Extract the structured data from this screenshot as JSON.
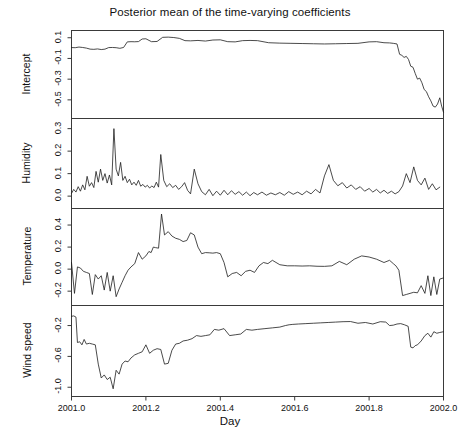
{
  "chart_data": {
    "type": "line",
    "title": "Posterior mean of the time-varying coefficients",
    "xlabel": "Day",
    "ylabel": "",
    "grid": false,
    "legend": "none",
    "xlim": [
      2001.0,
      2002.0
    ],
    "xticks": [
      2001.0,
      2001.2,
      2001.4,
      2001.6,
      2001.8,
      2002.0
    ],
    "xticklabels": [
      "2001.0",
      "2001.2",
      "2001.4",
      "2001.6",
      "2001.8",
      "2002.0"
    ],
    "panels": [
      {
        "name": "intercept",
        "ylabel": "Intercept",
        "ylim": [
          -0.68,
          0.17
        ],
        "yticks": [
          0.1,
          -0.1,
          -0.3,
          -0.5
        ],
        "yticklabels": [
          "0.1",
          "-0.1",
          "-0.3",
          "-0.5"
        ],
        "x": [
          2001.0,
          2001.01,
          2001.02,
          2001.03,
          2001.04,
          2001.05,
          2001.06,
          2001.07,
          2001.08,
          2001.09,
          2001.1,
          2001.11,
          2001.12,
          2001.13,
          2001.14,
          2001.15,
          2001.16,
          2001.17,
          2001.18,
          2001.19,
          2001.2,
          2001.215,
          2001.23,
          2001.245,
          2001.26,
          2001.275,
          2001.29,
          2001.305,
          2001.32,
          2001.34,
          2001.36,
          2001.38,
          2001.4,
          2001.42,
          2001.44,
          2001.46,
          2001.48,
          2001.5,
          2001.53,
          2001.56,
          2001.59,
          2001.62,
          2001.65,
          2001.68,
          2001.71,
          2001.74,
          2001.77,
          2001.8,
          2001.82,
          2001.84,
          2001.855,
          2001.865,
          2001.875,
          2001.882,
          2001.888,
          2001.894,
          2001.9,
          2001.906,
          2001.912,
          2001.918,
          2001.924,
          2001.93,
          2001.936,
          2001.942,
          2001.948,
          2001.954,
          2001.96,
          2001.966,
          2001.972,
          2001.978,
          2001.984,
          2001.99,
          2001.995,
          2002.0
        ],
        "y": [
          0.005,
          0.004,
          0.01,
          0.006,
          0.0,
          -0.01,
          -0.012,
          -0.008,
          -0.014,
          -0.01,
          0.005,
          0.006,
          0.004,
          -0.002,
          0.006,
          0.06,
          0.062,
          0.061,
          0.063,
          0.088,
          0.09,
          0.062,
          0.064,
          0.104,
          0.106,
          0.102,
          0.094,
          0.072,
          0.07,
          0.074,
          0.068,
          0.078,
          0.08,
          0.062,
          0.06,
          0.072,
          0.074,
          0.072,
          0.052,
          0.048,
          0.046,
          0.044,
          0.042,
          0.04,
          0.042,
          0.044,
          0.046,
          0.06,
          0.062,
          0.052,
          0.05,
          0.046,
          0.04,
          -0.06,
          -0.07,
          -0.09,
          -0.08,
          -0.11,
          -0.175,
          -0.185,
          -0.245,
          -0.3,
          -0.29,
          -0.335,
          -0.4,
          -0.42,
          -0.47,
          -0.51,
          -0.56,
          -0.57,
          -0.54,
          -0.48,
          -0.56,
          -0.62
        ]
      },
      {
        "name": "humidity",
        "ylabel": "Humidity",
        "ylim": [
          -0.055,
          0.345
        ],
        "yticks": [
          0.3,
          0.2,
          0.1,
          0.0
        ],
        "yticklabels": [
          "0.3",
          "0.2",
          "0.1",
          "0.0"
        ],
        "x": [
          2001.0,
          2001.006,
          2001.012,
          2001.018,
          2001.024,
          2001.03,
          2001.036,
          2001.042,
          2001.048,
          2001.054,
          2001.06,
          2001.066,
          2001.072,
          2001.078,
          2001.084,
          2001.09,
          2001.096,
          2001.102,
          2001.108,
          2001.114,
          2001.12,
          2001.126,
          2001.132,
          2001.138,
          2001.144,
          2001.15,
          2001.156,
          2001.162,
          2001.168,
          2001.174,
          2001.18,
          2001.186,
          2001.192,
          2001.198,
          2001.204,
          2001.21,
          2001.216,
          2001.222,
          2001.228,
          2001.234,
          2001.24,
          2001.248,
          2001.256,
          2001.264,
          2001.272,
          2001.28,
          2001.288,
          2001.296,
          2001.304,
          2001.312,
          2001.32,
          2001.33,
          2001.34,
          2001.35,
          2001.36,
          2001.37,
          2001.38,
          2001.39,
          2001.4,
          2001.41,
          2001.42,
          2001.43,
          2001.44,
          2001.45,
          2001.46,
          2001.47,
          2001.48,
          2001.49,
          2001.5,
          2001.512,
          2001.524,
          2001.536,
          2001.548,
          2001.56,
          2001.572,
          2001.584,
          2001.596,
          2001.608,
          2001.62,
          2001.632,
          2001.644,
          2001.656,
          2001.668,
          2001.68,
          2001.692,
          2001.704,
          2001.716,
          2001.728,
          2001.74,
          2001.752,
          2001.764,
          2001.776,
          2001.788,
          2001.8,
          2001.81,
          2001.82,
          2001.83,
          2001.84,
          2001.85,
          2001.86,
          2001.87,
          2001.88,
          2001.89,
          2001.9,
          2001.91,
          2001.92,
          2001.93,
          2001.94,
          2001.95,
          2001.96,
          2001.97,
          2001.98,
          2001.99,
          2002.0
        ],
        "y": [
          0.012,
          0.03,
          0.018,
          0.042,
          0.022,
          0.05,
          0.028,
          0.088,
          0.044,
          0.06,
          0.038,
          0.11,
          0.062,
          0.12,
          0.07,
          0.1,
          0.058,
          0.094,
          0.05,
          0.3,
          0.12,
          0.09,
          0.15,
          0.07,
          0.088,
          0.06,
          0.075,
          0.05,
          0.062,
          0.048,
          0.07,
          0.044,
          0.052,
          0.04,
          0.048,
          0.036,
          0.045,
          0.038,
          0.062,
          0.04,
          0.185,
          0.07,
          0.042,
          0.055,
          0.038,
          0.048,
          0.03,
          0.042,
          0.06,
          0.026,
          0.01,
          0.12,
          0.055,
          0.02,
          0.006,
          0.03,
          0.002,
          0.022,
          0.004,
          0.026,
          0.006,
          0.024,
          0.008,
          0.02,
          0.004,
          0.018,
          0.002,
          0.016,
          0.006,
          0.018,
          0.004,
          0.014,
          0.006,
          0.016,
          0.004,
          0.02,
          0.008,
          0.018,
          0.006,
          0.022,
          0.01,
          0.03,
          0.014,
          0.09,
          0.14,
          0.07,
          0.046,
          0.06,
          0.036,
          0.05,
          0.03,
          0.042,
          0.022,
          0.034,
          0.018,
          0.03,
          0.014,
          0.026,
          0.012,
          0.022,
          0.01,
          0.02,
          0.045,
          0.1,
          0.06,
          0.13,
          0.07,
          0.05,
          0.08,
          0.03,
          0.055,
          0.028,
          0.04
        ]
      },
      {
        "name": "temperature",
        "ylabel": "Temperature",
        "ylim": [
          -0.33,
          0.55
        ],
        "yticks": [
          0.4,
          0.2,
          0.0,
          -0.2
        ],
        "yticklabels": [
          "0.4",
          "0.2",
          "0.0",
          "-0.2"
        ],
        "x": [
          2001.0,
          2001.008,
          2001.016,
          2001.024,
          2001.032,
          2001.04,
          2001.048,
          2001.056,
          2001.064,
          2001.072,
          2001.08,
          2001.088,
          2001.096,
          2001.104,
          2001.112,
          2001.12,
          2001.128,
          2001.136,
          2001.144,
          2001.152,
          2001.16,
          2001.17,
          2001.18,
          2001.19,
          2001.2,
          2001.208,
          2001.214,
          2001.22,
          2001.226,
          2001.234,
          2001.242,
          2001.25,
          2001.26,
          2001.27,
          2001.28,
          2001.29,
          2001.3,
          2001.31,
          2001.32,
          2001.33,
          2001.34,
          2001.35,
          2001.36,
          2001.37,
          2001.38,
          2001.39,
          2001.4,
          2001.41,
          2001.42,
          2001.432,
          2001.444,
          2001.456,
          2001.468,
          2001.48,
          2001.492,
          2001.504,
          2001.516,
          2001.528,
          2001.54,
          2001.56,
          2001.58,
          2001.6,
          2001.62,
          2001.64,
          2001.66,
          2001.68,
          2001.7,
          2001.72,
          2001.74,
          2001.76,
          2001.78,
          2001.8,
          2001.82,
          2001.84,
          2001.855,
          2001.865,
          2001.872,
          2001.88,
          2001.89,
          2001.9,
          2001.91,
          2001.92,
          2001.93,
          2001.94,
          2001.95,
          2001.958,
          2001.966,
          2001.974,
          2001.982,
          2001.99,
          2002.0
        ],
        "y": [
          0.06,
          -0.22,
          0.02,
          0.01,
          -0.02,
          -0.03,
          -0.04,
          -0.23,
          -0.05,
          -0.09,
          -0.06,
          -0.19,
          -0.03,
          -0.2,
          -0.06,
          -0.25,
          -0.18,
          -0.12,
          -0.06,
          -0.01,
          0.02,
          0.05,
          0.15,
          0.09,
          0.12,
          0.16,
          0.15,
          0.2,
          0.195,
          0.19,
          0.5,
          0.31,
          0.34,
          0.3,
          0.28,
          0.27,
          0.25,
          0.26,
          0.33,
          0.31,
          0.2,
          0.14,
          0.15,
          0.148,
          0.145,
          0.15,
          0.14,
          0.06,
          -0.07,
          -0.04,
          -0.03,
          -0.06,
          -0.02,
          -0.01,
          -0.03,
          0.03,
          0.06,
          0.05,
          0.08,
          0.04,
          0.03,
          0.03,
          0.028,
          0.03,
          0.026,
          0.025,
          0.03,
          0.07,
          0.04,
          0.09,
          0.12,
          0.11,
          0.09,
          0.06,
          0.08,
          0.05,
          0.03,
          -0.01,
          -0.24,
          -0.23,
          -0.22,
          -0.21,
          -0.215,
          -0.15,
          -0.22,
          -0.06,
          -0.24,
          -0.07,
          -0.23,
          -0.09,
          -0.08
        ]
      },
      {
        "name": "wind_speed",
        "ylabel": "Wind speed",
        "ylim": [
          -1.12,
          0.06
        ],
        "yticks": [
          -0.2,
          -0.6,
          -1.0
        ],
        "yticklabels": [
          "-0.2",
          "-0.6",
          "-1.0"
        ],
        "x": [
          2001.0,
          2001.006,
          2001.012,
          2001.016,
          2001.022,
          2001.028,
          2001.034,
          2001.04,
          2001.048,
          2001.056,
          2001.064,
          2001.072,
          2001.08,
          2001.088,
          2001.096,
          2001.104,
          2001.112,
          2001.12,
          2001.128,
          2001.136,
          2001.144,
          2001.152,
          2001.16,
          2001.17,
          2001.18,
          2001.19,
          2001.2,
          2001.21,
          2001.22,
          2001.23,
          2001.24,
          2001.25,
          2001.26,
          2001.27,
          2001.28,
          2001.29,
          2001.3,
          2001.312,
          2001.324,
          2001.336,
          2001.348,
          2001.36,
          2001.372,
          2001.384,
          2001.396,
          2001.41,
          2001.425,
          2001.44,
          2001.455,
          2001.47,
          2001.485,
          2001.5,
          2001.52,
          2001.54,
          2001.56,
          2001.575,
          2001.585,
          2001.595,
          2001.61,
          2001.63,
          2001.65,
          2001.67,
          2001.69,
          2001.71,
          2001.73,
          2001.75,
          2001.77,
          2001.79,
          2001.81,
          2001.83,
          2001.845,
          2001.855,
          2001.865,
          2001.875,
          2001.885,
          2001.895,
          2001.905,
          2001.912,
          2001.918,
          2001.924,
          2001.93,
          2001.94,
          2001.95,
          2001.958,
          2001.966,
          2001.974,
          2001.982,
          2001.99,
          2002.0
        ],
        "y": [
          -0.08,
          -0.075,
          -0.09,
          -0.42,
          -0.41,
          -0.45,
          -0.38,
          -0.44,
          -0.43,
          -0.44,
          -0.45,
          -0.7,
          -0.88,
          -0.84,
          -0.9,
          -0.87,
          -1.02,
          -0.78,
          -0.83,
          -0.7,
          -0.66,
          -0.67,
          -0.62,
          -0.58,
          -0.56,
          -0.54,
          -0.45,
          -0.56,
          -0.52,
          -0.5,
          -0.51,
          -0.7,
          -0.69,
          -0.52,
          -0.44,
          -0.43,
          -0.4,
          -0.39,
          -0.37,
          -0.33,
          -0.34,
          -0.33,
          -0.32,
          -0.25,
          -0.26,
          -0.24,
          -0.33,
          -0.32,
          -0.31,
          -0.25,
          -0.26,
          -0.25,
          -0.24,
          -0.23,
          -0.22,
          -0.2,
          -0.19,
          -0.185,
          -0.18,
          -0.175,
          -0.17,
          -0.165,
          -0.16,
          -0.155,
          -0.15,
          -0.148,
          -0.17,
          -0.16,
          -0.18,
          -0.15,
          -0.155,
          -0.2,
          -0.195,
          -0.18,
          -0.175,
          -0.19,
          -0.21,
          -0.48,
          -0.49,
          -0.46,
          -0.45,
          -0.4,
          -0.33,
          -0.3,
          -0.35,
          -0.28,
          -0.3,
          -0.29,
          -0.28
        ]
      }
    ]
  },
  "caption": ""
}
